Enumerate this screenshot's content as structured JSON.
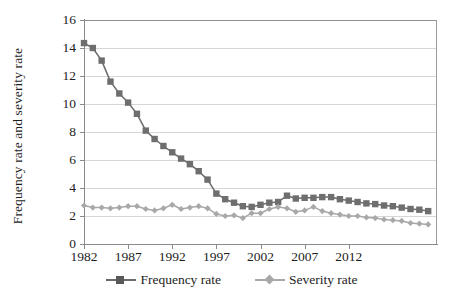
{
  "chart_data": {
    "type": "line",
    "title": "",
    "xlabel": "",
    "ylabel": "Frequency rate and severity rate",
    "xlim": [
      1982,
      2022
    ],
    "ylim": [
      0,
      16
    ],
    "ytick_step": 2,
    "yticks": [
      0,
      2,
      4,
      6,
      8,
      10,
      12,
      14,
      16
    ],
    "xticks": [
      1982,
      1987,
      1992,
      1997,
      2002,
      2007,
      2012
    ],
    "grid": "horizontal",
    "legend_position": "bottom",
    "x": [
      1982,
      1983,
      1984,
      1985,
      1986,
      1987,
      1988,
      1989,
      1990,
      1991,
      1992,
      1993,
      1994,
      1995,
      1996,
      1997,
      1998,
      1999,
      2000,
      2001,
      2002,
      2003,
      2004,
      2005,
      2006,
      2007,
      2008,
      2009,
      2010,
      2011,
      2012,
      2013,
      2014,
      2015,
      2016,
      2017,
      2018,
      2019,
      2020,
      2021
    ],
    "series": [
      {
        "name": "Frequency rate",
        "marker": "square",
        "color": "#6b6b6b",
        "values": [
          14.35,
          14.0,
          13.1,
          11.6,
          10.75,
          10.1,
          9.3,
          8.1,
          7.5,
          7.0,
          6.55,
          6.1,
          5.7,
          5.2,
          4.6,
          3.6,
          3.2,
          2.95,
          2.7,
          2.65,
          2.8,
          2.95,
          3.0,
          3.45,
          3.25,
          3.3,
          3.3,
          3.35,
          3.35,
          3.2,
          3.1,
          3.0,
          2.9,
          2.85,
          2.75,
          2.7,
          2.6,
          2.5,
          2.45,
          2.35
        ]
      },
      {
        "name": "Severity rate",
        "marker": "diamond",
        "color": "#a8a8a8",
        "values": [
          2.75,
          2.6,
          2.6,
          2.55,
          2.6,
          2.7,
          2.7,
          2.5,
          2.4,
          2.55,
          2.8,
          2.5,
          2.6,
          2.7,
          2.55,
          2.15,
          2.0,
          2.05,
          1.85,
          2.2,
          2.2,
          2.5,
          2.65,
          2.55,
          2.3,
          2.4,
          2.65,
          2.35,
          2.2,
          2.1,
          2.0,
          2.0,
          1.9,
          1.85,
          1.75,
          1.7,
          1.65,
          1.5,
          1.45,
          1.4
        ]
      }
    ]
  },
  "legend": {
    "items": [
      {
        "label": "Frequency rate"
      },
      {
        "label": "Severity rate"
      }
    ]
  },
  "axes": {
    "y_title": "Frequency rate and severity rate"
  },
  "colors": {
    "frequency": "#6b6b6b",
    "severity": "#a8a8a8",
    "grid": "#d6d6d6",
    "axis": "#8a8a8a",
    "text": "#1d1d1d"
  }
}
